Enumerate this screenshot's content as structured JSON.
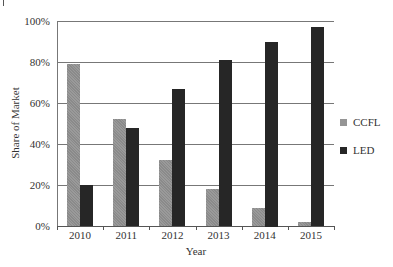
{
  "chart_data": {
    "type": "bar",
    "title": "",
    "xlabel": "Year",
    "ylabel": "Share of Market",
    "categories": [
      "2010",
      "2011",
      "2012",
      "2013",
      "2014",
      "2015"
    ],
    "series": [
      {
        "name": "CCFL",
        "color": "#959595",
        "values": [
          79,
          52,
          32,
          18,
          9,
          2
        ]
      },
      {
        "name": "LED",
        "color": "#262626",
        "values": [
          20,
          48,
          67,
          81,
          90,
          97
        ]
      }
    ],
    "ylim": [
      0,
      100
    ],
    "yticks": [
      "0%",
      "20%",
      "40%",
      "60%",
      "80%",
      "100%"
    ],
    "grid": true,
    "legend_position": "right"
  }
}
